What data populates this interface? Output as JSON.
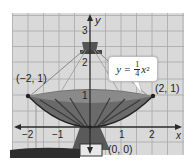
{
  "figure": {
    "axes": {
      "x_label": "x",
      "y_label": "y",
      "x_ticks": [
        "−2",
        "−1",
        "1",
        "2"
      ],
      "y_ticks": [
        "1",
        "2",
        "3"
      ]
    },
    "equation": {
      "lhs": "y",
      "equals": "=",
      "frac_num": "1",
      "frac_den": "4",
      "var": "x",
      "exp": "2"
    },
    "points": [
      {
        "label": "(−2, 1)",
        "x": -2,
        "y": 1
      },
      {
        "label": "(2, 1)",
        "x": 2,
        "y": 1
      },
      {
        "label": "(0, 0)",
        "x": 0,
        "y": 0
      }
    ],
    "colors": {
      "grid_bg": "#d9d9d9",
      "grid_line": "#a8a8a8",
      "axis": "#2a2a2a",
      "dish_dark": "#3a3a3a",
      "dish_mid": "#6a6a6a"
    }
  }
}
